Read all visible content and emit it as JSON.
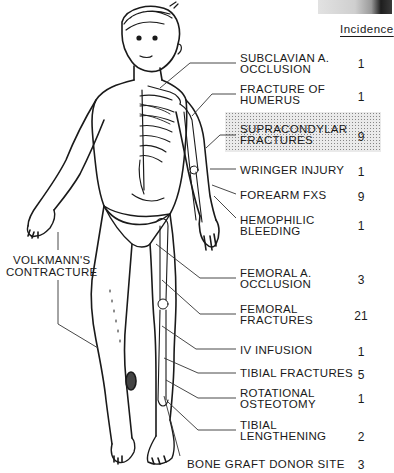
{
  "figure": {
    "incidence_header": "Incidence",
    "highlighted_item_index": 2,
    "items": [
      {
        "label": "SUBCLAVIAN A.\nOCCLUSION",
        "incidence": "1"
      },
      {
        "label": "FRACTURE OF\nHUMERUS",
        "incidence": "1"
      },
      {
        "label": "SUPRACONDYLAR\nFRACTURES",
        "incidence": "9"
      },
      {
        "label": "WRINGER INJURY",
        "incidence": "1"
      },
      {
        "label": "FOREARM FXS",
        "incidence": "9"
      },
      {
        "label": "HEMOPHILIC\nBLEEDING",
        "incidence": "1"
      },
      {
        "label": "FEMORAL A.\nOCCLUSION",
        "incidence": "3"
      },
      {
        "label": "FEMORAL\nFRACTURES",
        "incidence": "21"
      },
      {
        "label": "IV INFUSION",
        "incidence": "1"
      },
      {
        "label": "TIBIAL FRACTURES",
        "incidence": "5"
      },
      {
        "label": "ROTATIONAL\nOSTEOTOMY",
        "incidence": "1"
      },
      {
        "label": "TIBIAL\nLENGTHENING",
        "incidence": "2"
      }
    ],
    "bottom_item": {
      "label": "BONE GRAFT DONOR SITE",
      "incidence": "3"
    },
    "left_item": {
      "label": "VOLKMANN'S\nCONTRACTURE"
    }
  },
  "colors": {
    "ink": "#1a1a1a",
    "highlight_dots": "#7a7a7a",
    "background": "#ffffff"
  }
}
